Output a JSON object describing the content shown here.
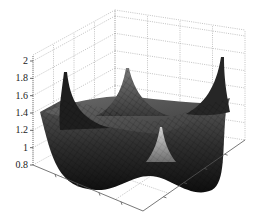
{
  "chart_data": {
    "type": "surface3d",
    "title": "",
    "xlabel": "",
    "ylabel": "",
    "zlabel": "",
    "grid": true,
    "legend": null,
    "colormap": "gray",
    "zlim": [
      0.7,
      2.05
    ],
    "zticks": [
      "0.8",
      "1",
      "1.2",
      "1.4",
      "1.6",
      "1.8",
      "2"
    ],
    "x_ticks_count": 5,
    "y_ticks_count": 5,
    "x_tick_labels": [],
    "y_tick_labels": [],
    "surface_description": "Bowl-shaped surface with a flat floor near z≈1.0 and four sharp corner spikes",
    "features": [
      {
        "name": "left-corner-spike",
        "z_peak": 1.85
      },
      {
        "name": "back-corner-spike",
        "z_peak": 1.9
      },
      {
        "name": "right-corner-spike",
        "z_peak": 2.0
      },
      {
        "name": "front-corner-spike",
        "z_peak": 1.2
      }
    ],
    "floor_level": 1.0,
    "min_level": 0.75
  }
}
